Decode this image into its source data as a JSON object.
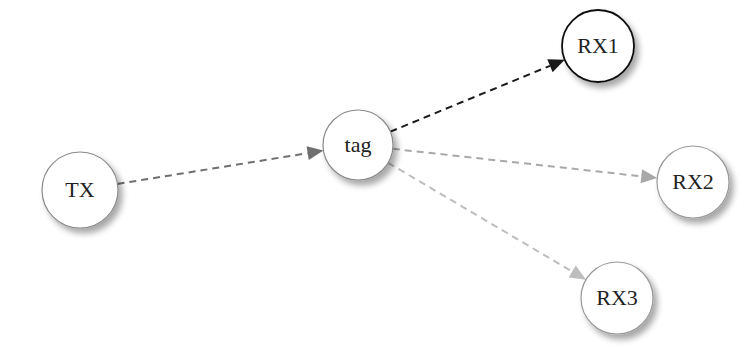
{
  "diagram": {
    "type": "directed-graph",
    "nodes": [
      {
        "id": "TX",
        "label": "TX",
        "cx": 80,
        "cy": 190,
        "r": 38,
        "stroke": "#8a8a8a",
        "stroke_width": 1.2
      },
      {
        "id": "tag",
        "label": "tag",
        "cx": 358,
        "cy": 145,
        "r": 35,
        "stroke": "#8a8a8a",
        "stroke_width": 1.2
      },
      {
        "id": "RX1",
        "label": "RX1",
        "cx": 598,
        "cy": 46,
        "r": 36,
        "stroke": "#111111",
        "stroke_width": 1.8
      },
      {
        "id": "RX2",
        "label": "RX2",
        "cx": 693,
        "cy": 182,
        "r": 36,
        "stroke": "#9a9a9a",
        "stroke_width": 1.2
      },
      {
        "id": "RX3",
        "label": "RX3",
        "cx": 617,
        "cy": 298,
        "r": 36,
        "stroke": "#9a9a9a",
        "stroke_width": 1.2
      }
    ],
    "edges": [
      {
        "from": "TX",
        "to": "tag",
        "color": "#6f6f6f",
        "style": "dashed"
      },
      {
        "from": "tag",
        "to": "RX1",
        "color": "#1a1a1a",
        "style": "dashed"
      },
      {
        "from": "tag",
        "to": "RX2",
        "color": "#a8a8a8",
        "style": "dashed"
      },
      {
        "from": "tag",
        "to": "RX3",
        "color": "#bdbdbd",
        "style": "dashed"
      }
    ]
  }
}
